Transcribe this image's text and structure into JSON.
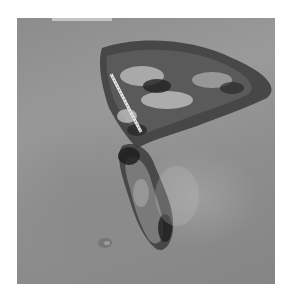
{
  "image": {
    "description": "Grayscale clinical photograph of skin with two ulcerated wound regions; a measurement scale is placed across the upper wound",
    "background": "#ffffff",
    "photo_frame": {
      "x": 17,
      "y": 18,
      "width": 258,
      "height": 266
    },
    "colors": {
      "skin": "#939393",
      "wound_dark": "#2a2a2a",
      "wound_mid": "#5e5e5e",
      "slough_light": "#cfcfcf",
      "scale_ruler": "#e8e8e8"
    }
  }
}
